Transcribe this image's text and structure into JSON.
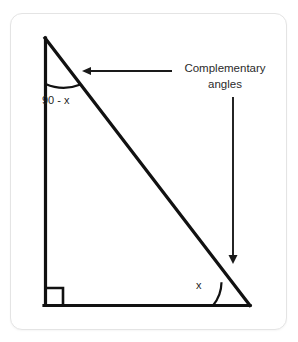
{
  "card": {
    "background": "#ffffff",
    "border_color": "#e4e4e4"
  },
  "figure": {
    "stroke_color": "#111111",
    "text_color": "#1f1f1f",
    "labels": {
      "top_angle": "90 - x",
      "bottom_angle": "x",
      "callout_line1": "Complementary",
      "callout_line2": "angles"
    },
    "geometry": {
      "vertex_top": [
        45,
        38
      ],
      "vertex_bottom_left": [
        45,
        305
      ],
      "vertex_bottom_right": [
        250,
        305
      ],
      "right_angle_at": "bottom-left",
      "right_angle_mark_size": 17
    },
    "annotations": {
      "horizontal_arrow": {
        "from": [
          170,
          71
        ],
        "to": [
          82,
          71
        ],
        "direction": "left",
        "points_to": "hypotenuse"
      },
      "vertical_arrow": {
        "from": [
          233,
          97
        ],
        "to": [
          233,
          263
        ],
        "direction": "down",
        "points_to": "bottom-right-angle"
      }
    }
  }
}
